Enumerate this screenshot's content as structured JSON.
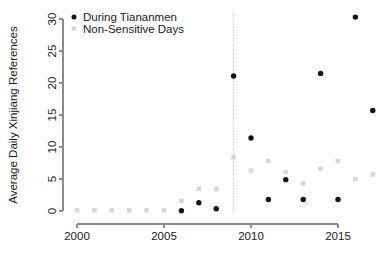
{
  "chart_data": {
    "type": "scatter",
    "title": "",
    "xlabel": "",
    "ylabel": "Average Daily Xinjiang References",
    "xlim": [
      1999.2,
      2017.8
    ],
    "ylim": [
      0,
      31
    ],
    "xticks": [
      2000,
      2005,
      2010,
      2015
    ],
    "yticks": [
      0,
      5,
      10,
      15,
      20,
      25,
      30
    ],
    "grid": false,
    "legend_position": "top-left",
    "annotations": [
      {
        "type": "vertical-line",
        "x": 2009,
        "style": "dotted",
        "color": "#b8b8b8"
      }
    ],
    "series": [
      {
        "name": "During Tiananmen",
        "marker": "circle",
        "color": "#131313",
        "x": [
          2006,
          2007,
          2008,
          2009,
          2010,
          2011,
          2012,
          2013,
          2014,
          2015,
          2016,
          2017
        ],
        "values": [
          0.05,
          1.3,
          0.35,
          21.1,
          11.4,
          1.8,
          4.9,
          1.8,
          21.5,
          1.8,
          30.3,
          15.7
        ]
      },
      {
        "name": "Non-Sensitive Days",
        "marker": "square",
        "color": "#d8d8d8",
        "x": [
          2000,
          2001,
          2002,
          2003,
          2004,
          2005,
          2006,
          2007,
          2008,
          2009,
          2010,
          2011,
          2012,
          2013,
          2014,
          2015,
          2016,
          2017
        ],
        "values": [
          0.1,
          0.1,
          0.1,
          0.1,
          0.1,
          0.1,
          1.6,
          3.5,
          3.4,
          8.4,
          6.3,
          7.8,
          6.1,
          4.3,
          6.6,
          7.8,
          5.0,
          5.7
        ]
      }
    ]
  },
  "legend": {
    "entries": [
      {
        "label": "During Tiananmen",
        "color": "#131313",
        "marker": "circle"
      },
      {
        "label": "Non-Sensitive Days",
        "color": "#d8d8d8",
        "marker": "square"
      }
    ]
  },
  "axes": {
    "y_title": "Average Daily Xinjiang References",
    "y_tick_labels": [
      "0",
      "5",
      "10",
      "15",
      "20",
      "25",
      "30"
    ],
    "x_tick_labels": [
      "2000",
      "2005",
      "2010",
      "2015"
    ]
  },
  "colors": {
    "sensitive": "#131313",
    "nonsensitive": "#d8d8d8",
    "axis": "#8c8c8c",
    "vline": "#b8b8b8",
    "text": "#1a1a1a",
    "background": "#ffffff"
  }
}
